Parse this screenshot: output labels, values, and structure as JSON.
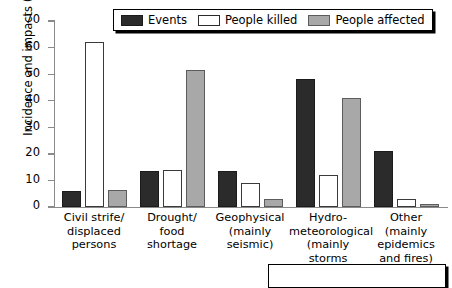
{
  "chart_data": {
    "type": "bar",
    "title": "",
    "xlabel": "",
    "ylabel": "Incidence and impacts (%)",
    "ylim": [
      0,
      70
    ],
    "yticks": [
      "0",
      "10",
      "20",
      "30",
      "40",
      "50",
      "60",
      "70"
    ],
    "grid": false,
    "legend_position": "top-center",
    "categories": [
      "Civil strife/\ndisplaced\npersons",
      "Drought/\nfood\nshortage",
      "Geophysical\n(mainly\nseismic)",
      "Hydro-\nmeteorological\n(mainly storms\nand floods)",
      "Other\n(mainly\nepidemics\nand fires)"
    ],
    "category_lines": [
      [
        "Civil strife/",
        "displaced",
        "persons"
      ],
      [
        "Drought/",
        "food",
        "shortage"
      ],
      [
        "Geophysical",
        "(mainly",
        "seismic)"
      ],
      [
        "Hydro-",
        "meteorological",
        "(mainly storms",
        "and floods)"
      ],
      [
        "Other",
        "(mainly",
        "epidemics",
        "and fires)"
      ]
    ],
    "series": [
      {
        "name": "Events",
        "color": "#2b2b2b",
        "values": [
          6,
          13.5,
          13.5,
          48,
          21
        ]
      },
      {
        "name": "People killed",
        "color": "#ffffff",
        "values": [
          62,
          14,
          9,
          12,
          3
        ]
      },
      {
        "name": "People affected",
        "color": "#a8a8a8",
        "values": [
          6.5,
          51.5,
          3,
          41,
          1
        ]
      }
    ]
  },
  "legend": {
    "items": [
      {
        "label": "Events",
        "swatch": "dark-swatch"
      },
      {
        "label": "People killed",
        "swatch": "white-swatch"
      },
      {
        "label": "People affected",
        "swatch": "gray-swatch"
      }
    ]
  },
  "footer": {
    "caption": ""
  }
}
